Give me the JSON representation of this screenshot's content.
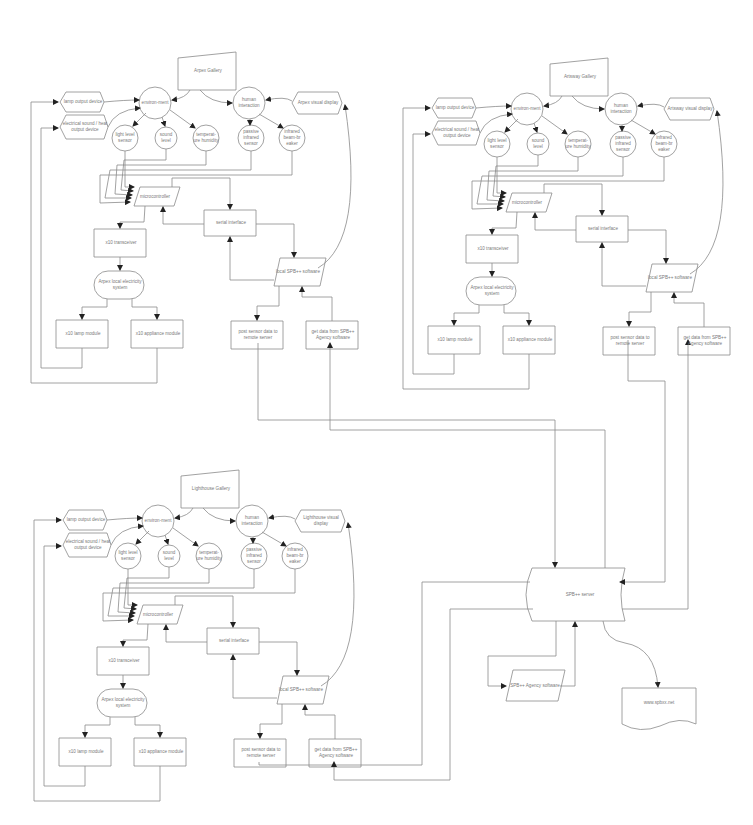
{
  "diagram": {
    "colors": {
      "line": "#8a8a8a",
      "text": "#7a7a7a",
      "background": "#ffffff"
    },
    "sites": [
      {
        "gallery": "Arpex Gallery",
        "environment": "environ-ment",
        "human_interaction": "human interaction",
        "visual_display": "Arpex visual display",
        "lamp_output": "lamp output device",
        "sound_heat_output": "electrical sound / heat output device",
        "light_sensor": "light level sensor",
        "sound_sensor": "sound level",
        "temp_sensor": "temperat-ure humidity",
        "pir_sensor": "passive infrared sensor",
        "beam_sensor": "infrared beam-br eaker",
        "microcontroller": "microcontroller",
        "serial": "serial interface",
        "x10_transceiver": "x10 transceiver",
        "electricity": "Arpex local electricity system",
        "x10_lamp": "x10 lamp module",
        "x10_appliance": "x10 appliance module",
        "local_software": "local SPB++ software",
        "post_data": "post sensor data to remote server",
        "get_data": "get data from SPB++ Agency software"
      },
      {
        "gallery": "Artsway Gallery",
        "environment": "environ-ment",
        "human_interaction": "human interaction",
        "visual_display": "Artsway visual display",
        "lamp_output": "lamp output device",
        "sound_heat_output": "electrical sound / heat output device",
        "light_sensor": "light level sensor",
        "sound_sensor": "sound level",
        "temp_sensor": "temperat-ure humidity",
        "pir_sensor": "passive infrared sensor",
        "beam_sensor": "infrared beam-br eaker",
        "microcontroller": "microcontroller",
        "serial": "serial interface",
        "x10_transceiver": "x10 transceiver",
        "electricity": "Arpex local electricity system",
        "x10_lamp": "x10 lamp module",
        "x10_appliance": "x10 appliance module",
        "local_software": "local SPB++ software",
        "post_data": "post sensor data to remote server",
        "get_data": "get data from SPB++ Agency software"
      },
      {
        "gallery": "Lighthouse Gallery",
        "environment": "environ-ment",
        "human_interaction": "human interaction",
        "visual_display": "Lighthouse visual display",
        "lamp_output": "lamp output device",
        "sound_heat_output": "electrical sound / heat output device",
        "light_sensor": "light level sensor",
        "sound_sensor": "sound level",
        "temp_sensor": "temperat-ure humidity",
        "pir_sensor": "passive infrared sensor",
        "beam_sensor": "infrared beam-br eaker",
        "microcontroller": "microcontroller",
        "serial": "serial interface",
        "x10_transceiver": "x10 transceiver",
        "electricity": "Arpex local electricity system",
        "x10_lamp": "x10 lamp module",
        "x10_appliance": "x10 appliance module",
        "local_software": "local SPB++ software",
        "post_data": "post sensor data to remote server",
        "get_data": "get data from SPB++ Agency software"
      }
    ],
    "central": {
      "server": "SPB++ server",
      "agency_software": "SPB++ Agency software",
      "website": "www.spbxx.net"
    }
  }
}
